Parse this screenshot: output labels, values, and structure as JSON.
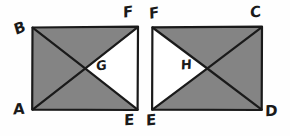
{
  "figure": {
    "background_color": "#fefefe",
    "shade_color": "#848484",
    "line_color": "#1a1a1a",
    "unshaded_color": "#ffffff",
    "line_width": 2,
    "style": "hand-drawn pencil sketch",
    "rectangles": [
      {
        "id": "left-rectangle",
        "x": 32,
        "y": 27,
        "width": 106,
        "height": 83,
        "corners": {
          "top_left": "B",
          "top_right": "F",
          "bottom_left": "A",
          "bottom_right": "E"
        },
        "diagonals": [
          "B-E",
          "A-F"
        ],
        "unshaded_region": {
          "label": "G",
          "vertices": [
            "center",
            "F",
            "E"
          ],
          "description": "right triangle between the two diagonals, unshaded"
        }
      },
      {
        "id": "right-rectangle",
        "x": 152,
        "y": 27,
        "width": 110,
        "height": 83,
        "corners": {
          "top_left": "F",
          "top_right": "C",
          "bottom_left": "E",
          "bottom_right": "D"
        },
        "diagonals": [
          "F-D",
          "E-C"
        ],
        "unshaded_region": {
          "label": "H",
          "vertices": [
            "F",
            "center",
            "E"
          ],
          "description": "left triangle between the two diagonals, unshaded"
        }
      }
    ],
    "labels": {
      "left": {
        "top_left": "B",
        "top_right": "F",
        "bottom_left": "A",
        "bottom_right": "E",
        "region": "G"
      },
      "right": {
        "top_left": "F",
        "top_right": "C",
        "bottom_left": "E",
        "bottom_right": "D",
        "region": "H"
      }
    }
  }
}
